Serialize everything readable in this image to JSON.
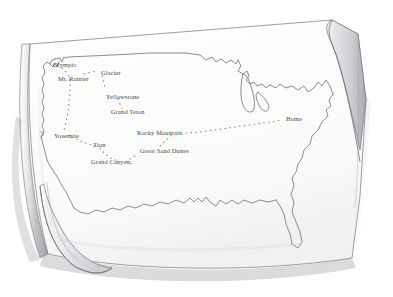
{
  "scene": {
    "title": "Hand-drawn United States road-trip map on a curled sheet of paper",
    "medium": "pencil-sketch",
    "paper_color": "#fbfbfa",
    "ink_color": "#6b6b72",
    "shadow_color": "#c9c9cc",
    "label_color": "#4a4a50"
  },
  "map": {
    "region": "united-states",
    "features": [
      "west-coast",
      "great-lakes",
      "florida",
      "gulf-coast",
      "northeast"
    ],
    "route_style": "dotted"
  },
  "labels": [
    {
      "name": "olympic",
      "text": "Olympic",
      "x": 53,
      "y": 62
    },
    {
      "name": "glacier",
      "text": "Glacier",
      "x": 101,
      "y": 70
    },
    {
      "name": "mt-rainier",
      "text": "Mt. Rainier",
      "x": 58,
      "y": 76
    },
    {
      "name": "yellowstone",
      "text": "Yellowstone",
      "x": 106,
      "y": 94
    },
    {
      "name": "grand-teton",
      "text": "Grand Teton",
      "x": 111,
      "y": 109
    },
    {
      "name": "home",
      "text": "Home",
      "x": 286,
      "y": 116
    },
    {
      "name": "rocky-mountain",
      "text": "Rocky Mountain",
      "x": 137,
      "y": 130
    },
    {
      "name": "yosemite",
      "text": "Yosemite",
      "x": 54,
      "y": 133
    },
    {
      "name": "zion",
      "text": "Zion",
      "x": 93,
      "y": 142
    },
    {
      "name": "great-sand-dunes",
      "text": "Great Sand Dunes",
      "x": 140,
      "y": 148
    },
    {
      "name": "grand-canyon",
      "text": "Grand Canyon,",
      "x": 91,
      "y": 159
    }
  ]
}
